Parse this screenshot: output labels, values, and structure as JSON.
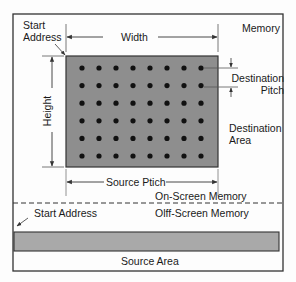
{
  "labels": {
    "memory": "Memory",
    "start_address_top_line1": "Start",
    "start_address_top_line2": "Address",
    "width": "Width",
    "height": "Height",
    "destination_pitch_line1": "Destination",
    "destination_pitch_line2": "Pitch",
    "destination_area_line1": "Destination",
    "destination_area_line2": "Area",
    "source_pitch": "Source Ptich",
    "on_screen_memory": "On-Screen Memory",
    "off_screen_memory": "Olff-Screen Memory",
    "start_address_bottom": "Start Address",
    "source_area": "Source Area"
  },
  "grid": {
    "columns": 8,
    "rows": 6
  },
  "colors": {
    "destination_fill": "#8e8e8e",
    "source_fill": "#a9a9a9",
    "dot": "#111111",
    "line": "#333333"
  }
}
